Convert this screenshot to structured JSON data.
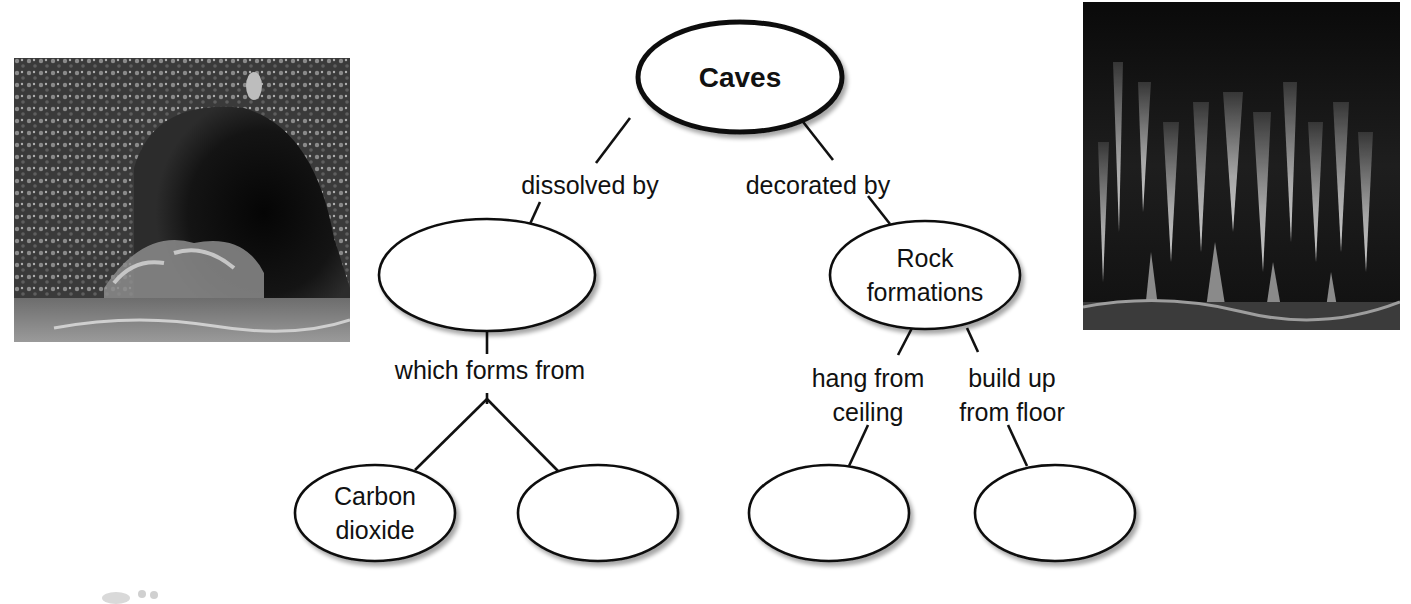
{
  "diagram": {
    "type": "concept-map",
    "root": {
      "id": "caves",
      "label": "Caves"
    },
    "nodes": [
      {
        "id": "caves",
        "lines": [
          "Caves"
        ],
        "cx": 740,
        "cy": 77,
        "rx": 102,
        "ry": 55,
        "bold": true
      },
      {
        "id": "dissolver",
        "lines": [],
        "cx": 487,
        "cy": 275,
        "rx": 108,
        "ry": 56
      },
      {
        "id": "rock-formations",
        "lines": [
          "Rock",
          "formations"
        ],
        "cx": 925,
        "cy": 275,
        "rx": 95,
        "ry": 54
      },
      {
        "id": "carbon-dioxide",
        "lines": [
          "Carbon",
          "dioxide"
        ],
        "cx": 375,
        "cy": 513,
        "rx": 80,
        "ry": 48
      },
      {
        "id": "second-source",
        "lines": [],
        "cx": 598,
        "cy": 513,
        "rx": 80,
        "ry": 48
      },
      {
        "id": "hanging-formation",
        "lines": [],
        "cx": 829,
        "cy": 513,
        "rx": 80,
        "ry": 48
      },
      {
        "id": "floor-formation",
        "lines": [],
        "cx": 1055,
        "cy": 513,
        "rx": 80,
        "ry": 48
      }
    ],
    "links": [
      {
        "id": "dissolved-by",
        "lines": [
          "dissolved by"
        ],
        "x": 590,
        "y": 185
      },
      {
        "id": "decorated-by",
        "lines": [
          "decorated by"
        ],
        "x": 818,
        "y": 185
      },
      {
        "id": "which-forms-from",
        "lines": [
          "which forms from"
        ],
        "x": 490,
        "y": 370
      },
      {
        "id": "hang-from-ceiling",
        "lines": [
          "hang from",
          "ceiling"
        ],
        "x": 868,
        "y": 378
      },
      {
        "id": "build-up-from-floor",
        "lines": [
          "build up",
          "from floor"
        ],
        "x": 1012,
        "y": 378
      }
    ],
    "edges": [
      [
        630,
        118,
        596,
        163
      ],
      [
        540,
        202,
        530,
        224
      ],
      [
        800,
        118,
        833,
        160
      ],
      [
        868,
        196,
        890,
        224
      ],
      [
        487,
        331,
        487,
        354
      ],
      [
        487,
        393,
        487,
        404
      ],
      [
        487,
        399,
        415,
        470
      ],
      [
        487,
        399,
        560,
        473
      ],
      [
        912,
        328,
        898,
        355
      ],
      [
        967,
        328,
        978,
        352
      ],
      [
        868,
        425,
        849,
        466
      ],
      [
        1008,
        425,
        1027,
        466
      ]
    ]
  },
  "images": [
    {
      "id": "cave-entrance-photo",
      "alt": "Photo of a cave entrance with jungle vegetation"
    },
    {
      "id": "cave-formations-photo",
      "alt": "Photo of stalactites and stalagmites inside a cave"
    }
  ],
  "colors": {
    "ink": "#111111",
    "background": "#ffffff",
    "shadow": "#c8c8c8"
  }
}
